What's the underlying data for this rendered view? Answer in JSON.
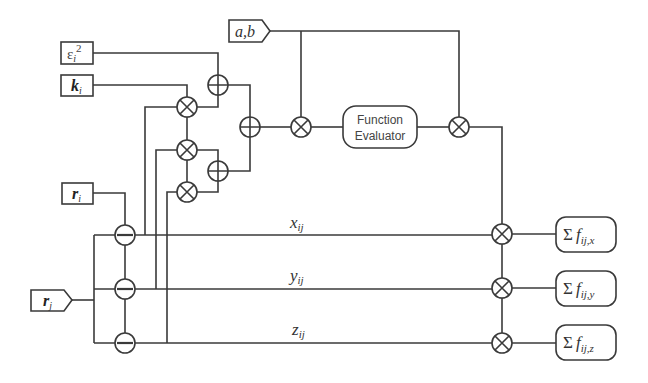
{
  "diagram": {
    "title": "",
    "inputs": {
      "ab": {
        "base": "a,b"
      },
      "eps": {
        "base": "ε",
        "sub": "i",
        "sup": "2"
      },
      "k": {
        "base": "k",
        "sub": "i"
      },
      "ri": {
        "base": "r",
        "sub": "i"
      },
      "rj": {
        "base": "r",
        "sub": "j"
      }
    },
    "function_evaluator": {
      "line1": "Function",
      "line2": "Evaluator"
    },
    "wire_labels": {
      "x": {
        "base": "x",
        "sub": "ij"
      },
      "y": {
        "base": "y",
        "sub": "ij"
      },
      "z": {
        "base": "z",
        "sub": "ij"
      }
    },
    "outputs": [
      {
        "sigma": "Σ",
        "base": "f",
        "sub": "ij,x"
      },
      {
        "sigma": "Σ",
        "base": "f",
        "sub": "ij,y"
      },
      {
        "sigma": "Σ",
        "base": "f",
        "sub": "ij,z"
      }
    ],
    "operators": {
      "add": "⊕",
      "multiply": "⊗",
      "subtract": "⊖"
    }
  }
}
